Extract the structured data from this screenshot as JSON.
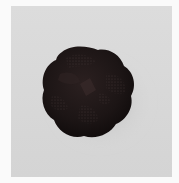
{
  "image": {
    "subject": "dark knotted lobed object photographed on a light gray background",
    "colors": {
      "outer_border": "#fafafa",
      "background": "#d7d7d7",
      "background_light": "#dedede",
      "object_dark": "#1a1313",
      "object_mid": "#2a1f1f",
      "object_highlight": "#4a3a3a",
      "shadow": "#b8b8b8"
    }
  }
}
